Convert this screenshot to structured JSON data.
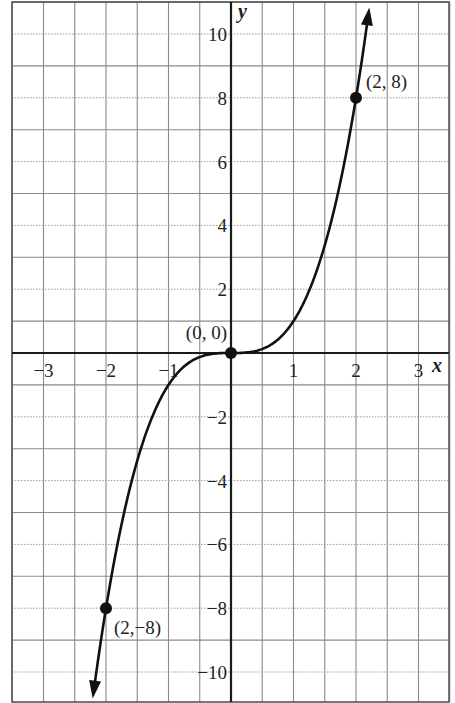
{
  "chart_data": {
    "type": "line",
    "title": "",
    "function": "y = x^3",
    "xlabel": "x",
    "ylabel": "y",
    "xlim": [
      -3.5,
      3.5
    ],
    "ylim": [
      -11,
      11
    ],
    "grid": true,
    "x_minor_step": 0.5,
    "y_minor_step": 1,
    "x_ticks": [
      -3,
      -2,
      -1,
      1,
      2,
      3
    ],
    "x_tick_labels": [
      "−3",
      "−2",
      "−1",
      "1",
      "2",
      "3"
    ],
    "y_ticks": [
      10,
      8,
      6,
      4,
      2,
      -2,
      -4,
      -6,
      -8,
      -10
    ],
    "y_tick_labels": [
      "10",
      "8",
      "6",
      "4",
      "2",
      "−2",
      "−4",
      "−6",
      "−8",
      "−10"
    ],
    "series": [
      {
        "name": "y = x^3",
        "x": [
          -2.2,
          -2,
          -1.5,
          -1,
          -0.5,
          0,
          0.5,
          1,
          1.5,
          2,
          2.2
        ],
        "y": [
          -10.65,
          -8,
          -3.375,
          -1,
          -0.125,
          0,
          0.125,
          1,
          3.375,
          8,
          10.65
        ],
        "arrows_at_ends": true
      }
    ],
    "points": [
      {
        "x": 2,
        "y": 8,
        "label": "(2, 8)"
      },
      {
        "x": 0,
        "y": 0,
        "label": "(0, 0)"
      },
      {
        "x": -2,
        "y": -8,
        "label": "(2,−8)"
      }
    ],
    "colors": {
      "curve": "#111111",
      "axis": "#1a1a1a",
      "grid": "#8a8a8a",
      "background": "#ffffff"
    }
  }
}
